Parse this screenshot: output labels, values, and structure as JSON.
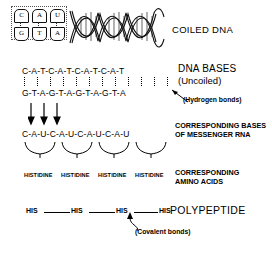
{
  "diagram": {
    "ink_color": "#000000",
    "background_color": "#ffffff"
  },
  "section_coiled": {
    "label": "COILED DNA",
    "helix_icon": "dna-double-helix-icon",
    "inset": {
      "top_bases": [
        "C",
        "A",
        "U"
      ],
      "bottom_bases": [
        "G",
        "T",
        "A"
      ],
      "bond_marks": [
        "dotted",
        "dotted",
        "dotted"
      ]
    }
  },
  "section_dna_bases": {
    "label": "DNA BASES",
    "sublabel": "(Uncoiled)",
    "top_strand": "C-A-T-C-A-T-C-A-T-C-A-T",
    "bottom_strand": "G-T-A-G-T-A-G-T-A-G-T-A",
    "top_bases": [
      "C",
      "A",
      "T",
      "C",
      "A",
      "T",
      "C",
      "A",
      "T",
      "C",
      "A",
      "T"
    ],
    "bottom_bases": [
      "G",
      "T",
      "A",
      "G",
      "T",
      "A",
      "G",
      "T",
      "A",
      "G",
      "T",
      "A"
    ],
    "bond_annotation": "(Hydrogen bonds)",
    "bond_count": 12
  },
  "section_transcription": {
    "arrow_icon": "down-arrow-icon",
    "arrow_count": 3
  },
  "section_mrna": {
    "strand": "C-A-U-C-A-U-C-A-U-C-A-U",
    "bases": [
      "C",
      "A",
      "U",
      "C",
      "A",
      "U",
      "C",
      "A",
      "U",
      "C",
      "A",
      "U"
    ],
    "label_line1": "CORRESPONDING BASES",
    "label_line2": "OF MESSENGER RNA"
  },
  "section_amino_acids": {
    "brace_icon": "codon-brace-icon",
    "brace_count": 4,
    "amino_acids": [
      "HISTIDINE",
      "HISTIDINE",
      "HISTIDINE",
      "HISTIDINE"
    ],
    "label_line1": "CORRESPONDING",
    "label_line2": "AMINO ACIDS"
  },
  "section_polypeptide": {
    "label": "POLYPEPTIDE",
    "residues": [
      "HIS",
      "HIS",
      "HIS",
      "HIS"
    ],
    "bond_annotation": "(Covalent bonds)",
    "bond_count": 3,
    "pointer_icon": "up-arrow-icon"
  }
}
